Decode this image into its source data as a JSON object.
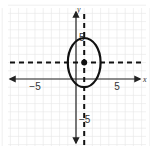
{
  "chart_data": {
    "type": "scatter",
    "title": "",
    "xlabel": "x",
    "ylabel": "y",
    "xlim": [
      -9,
      9
    ],
    "ylim": [
      -9,
      9
    ],
    "grid": true,
    "grid_step": 1,
    "x_ticks": [
      {
        "value": -5,
        "label": "−5"
      },
      {
        "value": 5,
        "label": "5"
      }
    ],
    "y_ticks": [
      {
        "value": 5,
        "label": "5"
      },
      {
        "value": -5,
        "label": "−5"
      }
    ],
    "ellipse": {
      "center": [
        1,
        2
      ],
      "semi_axis_x": 2,
      "semi_axis_y": 3,
      "equation": "(x-1)^2/4 + (y-2)^2/9 = 1"
    },
    "dashed_lines": [
      {
        "orientation": "vertical",
        "value": 1
      },
      {
        "orientation": "horizontal",
        "value": 2
      }
    ],
    "points": [
      {
        "x": 1,
        "y": 2,
        "label": "center"
      }
    ],
    "colors": {
      "curve": "#111111",
      "grid": "#e6e6e6",
      "axis": "#222222"
    }
  }
}
